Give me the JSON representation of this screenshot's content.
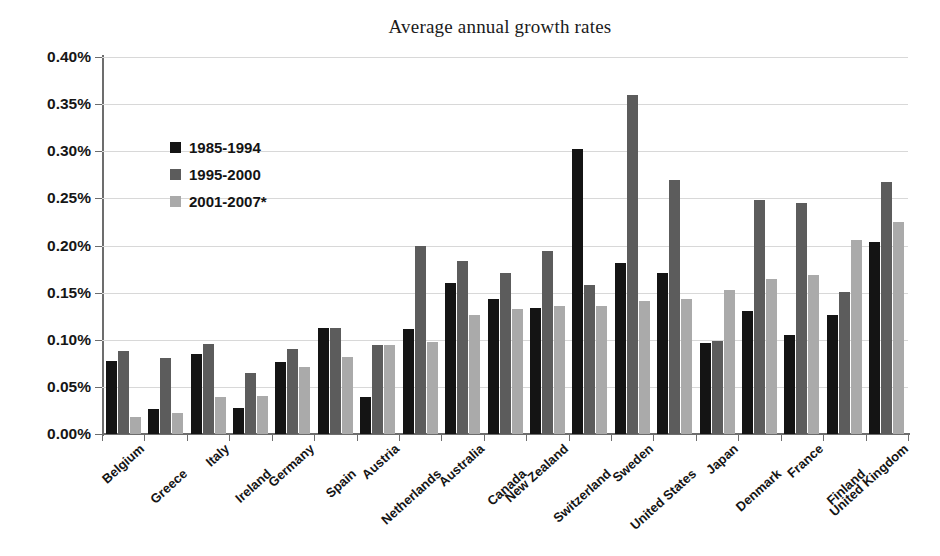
{
  "chart_data": {
    "type": "bar",
    "title": "Average annual growth rates",
    "xlabel": "",
    "ylabel": "",
    "ylim": [
      0,
      0.4
    ],
    "y_unit": "%",
    "y_ticks": [
      "0.00%",
      "0.05%",
      "0.10%",
      "0.15%",
      "0.20%",
      "0.25%",
      "0.30%",
      "0.35%",
      "0.40%"
    ],
    "y_tick_values": [
      0.0,
      0.05,
      0.1,
      0.15,
      0.2,
      0.25,
      0.3,
      0.35,
      0.4
    ],
    "grid": true,
    "legend_position": "upper-left-inside",
    "categories": [
      "Belgium",
      "Greece",
      "Italy",
      "Ireland",
      "Germany",
      "Spain",
      "Austria",
      "Netherlands",
      "Australia",
      "Canada",
      "New Zealand",
      "Switzerland",
      "Sweden",
      "United States",
      "Japan",
      "Denmark",
      "France",
      "Finland",
      "United Kingdom"
    ],
    "series": [
      {
        "name": "1985-1994",
        "color": "#141414",
        "values": [
          0.078,
          0.027,
          0.085,
          0.028,
          0.076,
          0.112,
          0.039,
          0.111,
          0.16,
          0.143,
          0.134,
          0.302,
          0.181,
          0.171,
          0.097,
          0.131,
          0.105,
          0.126,
          0.204
        ]
      },
      {
        "name": "1995-2000",
        "color": "#5c5c5c",
        "values": [
          0.088,
          0.081,
          0.095,
          0.065,
          0.09,
          0.113,
          0.094,
          0.2,
          0.184,
          0.171,
          0.194,
          0.158,
          0.36,
          0.269,
          0.099,
          0.248,
          0.245,
          0.151,
          0.267
        ]
      },
      {
        "name": "2001-2007*",
        "color": "#aaaaaa",
        "values": [
          0.018,
          0.022,
          0.039,
          0.04,
          0.071,
          0.082,
          0.094,
          0.098,
          0.126,
          0.133,
          0.136,
          0.136,
          0.141,
          0.143,
          0.153,
          0.165,
          0.169,
          0.206,
          0.225
        ]
      }
    ]
  }
}
